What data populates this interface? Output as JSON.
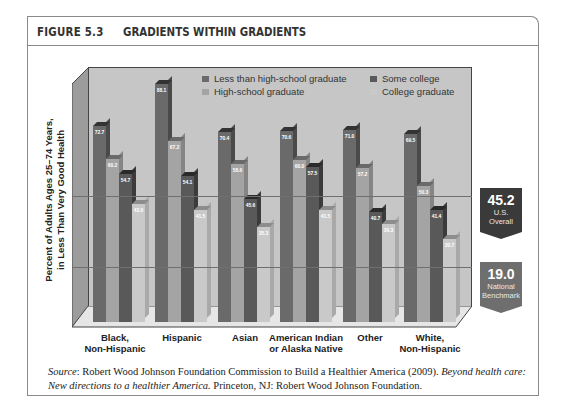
{
  "figure": {
    "number": "FIGURE 5.3",
    "title": "GRADIENTS WITHIN GRADIENTS"
  },
  "colors": {
    "less_than_hs": "#6a6a6a",
    "hs_grad": "#a4a4a4",
    "some_college": "#595959",
    "college_grad": "#c9c9c9",
    "plot_back": "#c6c6c6",
    "badge_us": "#3a3a3a",
    "badge_bench": "#6e6e6e"
  },
  "legend": [
    {
      "label": "Less than high-school graduate"
    },
    {
      "label": "High-school graduate"
    },
    {
      "label": "Some college"
    },
    {
      "label": "College graduate"
    }
  ],
  "references": {
    "us_overall": {
      "value": "45.2",
      "label_line1": "U.S.",
      "label_line2": "Overall"
    },
    "benchmark": {
      "value": "19.0",
      "label_line1": "National",
      "label_line2": "Benchmark"
    }
  },
  "source": {
    "prefix": "Source",
    "text1": ": Robert Wood Johnson Foundation Commission to Build a Healthier America (2009). ",
    "italic": "Beyond health care: New directions to a healthier America.",
    "text2": " Princeton, NJ: Robert Wood Johnson Foundation."
  },
  "chart_data": {
    "type": "bar",
    "title": "GRADIENTS WITHIN GRADIENTS",
    "xlabel": "",
    "ylabel": "Percent of Adults Ages 25–74 Years, in Less Than Very Good Health",
    "ylabel_line1": "Percent of Adults Ages 25–74 Years,",
    "ylabel_line2": "in Less Than Very Good Health",
    "categories": [
      "Black, Non-Hispanic",
      "Hispanic",
      "Asian",
      "American Indian or Alaska Native",
      "Other",
      "White, Non-Hispanic"
    ],
    "category_lines": [
      [
        "Black,",
        "Non-Hispanic"
      ],
      [
        "Hispanic",
        ""
      ],
      [
        "Asian",
        ""
      ],
      [
        "American Indian",
        "or Alaska Native"
      ],
      [
        "Other",
        ""
      ],
      [
        "White,",
        "Non-Hispanic"
      ]
    ],
    "series": [
      {
        "name": "Less than high-school graduate",
        "values": [
          72.7,
          88.1,
          70.4,
          70.6,
          71.0,
          69.5
        ]
      },
      {
        "name": "High-school graduate",
        "values": [
          60.2,
          67.2,
          58.6,
          60.0,
          57.2,
          50.3
        ]
      },
      {
        "name": "Some college",
        "values": [
          54.7,
          54.1,
          45.6,
          57.5,
          40.7,
          41.4
        ]
      },
      {
        "name": "College graduate",
        "values": [
          43.6,
          41.5,
          35.3,
          41.5,
          36.3,
          30.7
        ]
      }
    ],
    "reference_lines": [
      {
        "name": "U.S. Overall",
        "value": 45.2
      },
      {
        "name": "National Benchmark",
        "value": 19.0
      }
    ],
    "ylim": [
      0,
      95
    ],
    "grid": false,
    "legend_position": "top-inside",
    "style": "3d-bar"
  }
}
